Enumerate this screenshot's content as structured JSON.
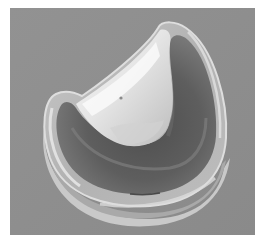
{
  "image": {
    "subject": "curved translucent polymer component (bearing insert) on gray background",
    "colors": {
      "background": "#8e8e8e",
      "rim_light": "#d8d8d8",
      "rim_mid": "#b4b4b4",
      "trough_dark": "#555555",
      "trough_mid": "#6e6e6e",
      "wall_highlight": "#f2f2f2",
      "wall_mid": "#cfcfcf",
      "border": "#ffffff"
    }
  }
}
